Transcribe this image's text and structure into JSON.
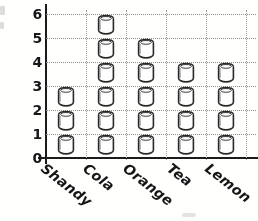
{
  "chart_data": {
    "type": "bar",
    "subtype": "pictogram",
    "title": "",
    "subtitle": "",
    "xlabel": "",
    "ylabel": "",
    "categories": [
      "Shandy",
      "Cola",
      "Orange",
      "Tea",
      "Lemon"
    ],
    "values": [
      3,
      6,
      5,
      4,
      4
    ],
    "series": [
      {
        "name": "Drinks",
        "values": [
          3,
          6,
          5,
          4,
          4
        ]
      }
    ],
    "ylim": [
      0,
      6
    ],
    "ytick_labels": [
      "0",
      "1",
      "2",
      "3",
      "4",
      "5",
      "6"
    ],
    "ytick_values": [
      0,
      1,
      2,
      3,
      4,
      5,
      6
    ],
    "grid": "dotted-both",
    "legend": "none",
    "icon": "cup-icon",
    "icon_unit_value": 1
  },
  "axes": {
    "y_ticks": [
      {
        "label": "6",
        "value": 6
      },
      {
        "label": "5",
        "value": 5
      },
      {
        "label": "4",
        "value": 4
      },
      {
        "label": "3",
        "value": 3
      },
      {
        "label": "2",
        "value": 2
      },
      {
        "label": "1",
        "value": 1
      },
      {
        "label": "0",
        "value": 0
      }
    ],
    "x_categories": [
      {
        "label": "Shandy",
        "count": 3
      },
      {
        "label": "Cola",
        "count": 6
      },
      {
        "label": "Orange",
        "count": 5
      },
      {
        "label": "Tea",
        "count": 4
      },
      {
        "label": "Lemon",
        "count": 4
      }
    ]
  },
  "colors": {
    "axis": "#1d1d1d",
    "grid": "#8c8c8c",
    "ink": "#181818",
    "paper": "#fdfdfc",
    "icon_stroke": "#2a2a2a"
  }
}
